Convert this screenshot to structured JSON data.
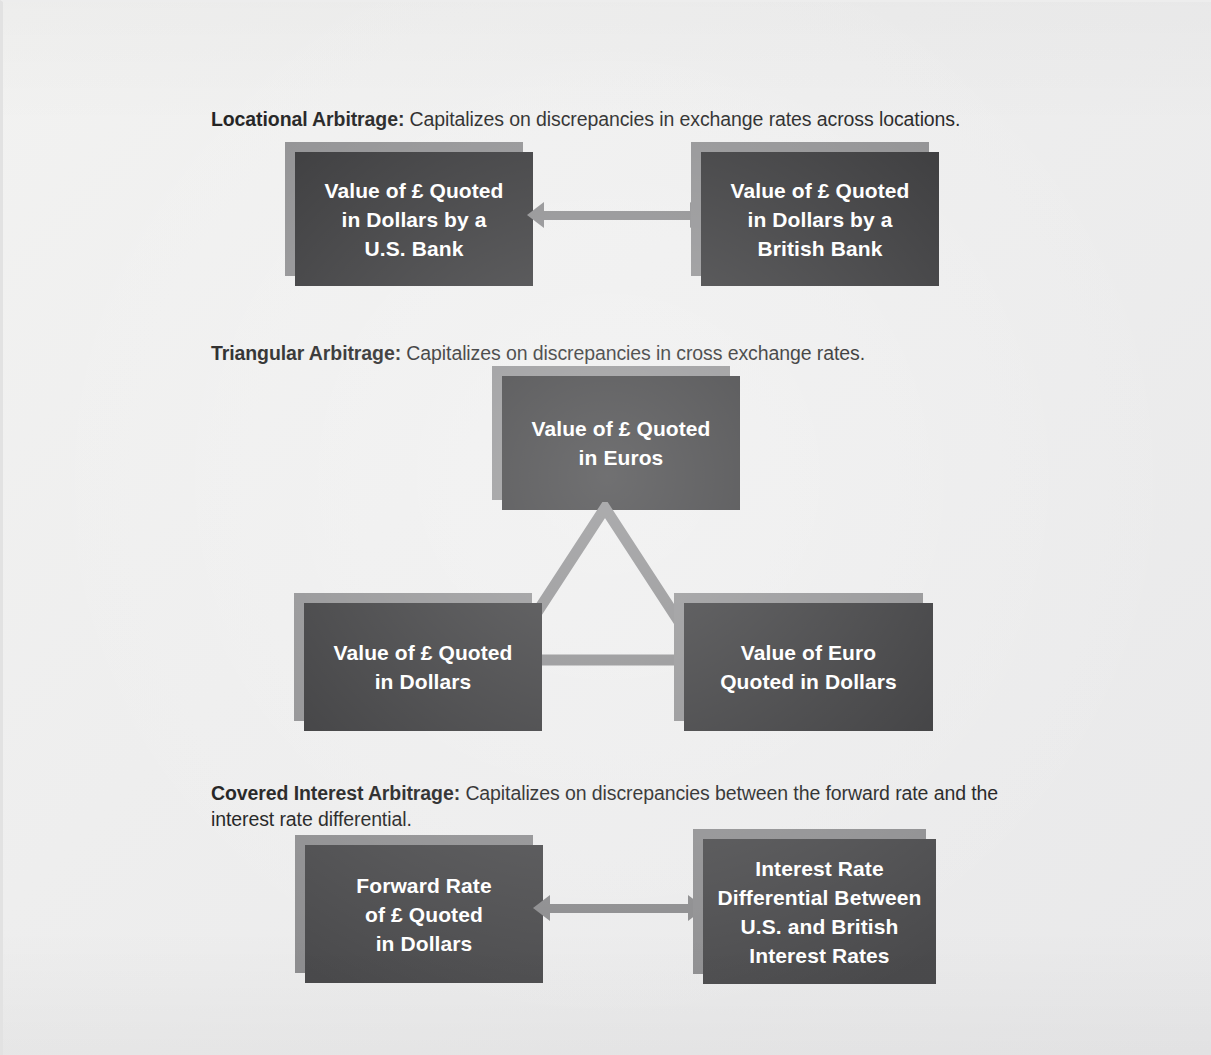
{
  "page": {
    "background_color": "#eceded",
    "box_fill_dark": "#333335",
    "box_fill_light": "#4a4a4c",
    "box_shadow_color": "#8e8e90",
    "connector_color": "#8a8a8c",
    "text_color": "#ffffff",
    "heading_color": "#1d1d1d"
  },
  "sections": [
    {
      "id": "locational",
      "lead": "Locational Arbitrage:",
      "description": " Capitalizes on discrepancies in exchange rates across locations.",
      "nodes": [
        {
          "id": "loc-us-bank",
          "lines": [
            "Value of £ Quoted",
            "in Dollars by a",
            "U.S. Bank"
          ]
        },
        {
          "id": "loc-british-bank",
          "lines": [
            "Value of £ Quoted",
            "in Dollars by a",
            "British Bank"
          ]
        }
      ],
      "connector": {
        "type": "double-arrow",
        "orientation": "horizontal"
      }
    },
    {
      "id": "triangular",
      "lead": "Triangular Arbitrage:",
      "description": " Capitalizes on discrepancies in cross exchange rates.",
      "nodes": [
        {
          "id": "tri-euros",
          "lines": [
            "Value of £ Quoted",
            "in Euros"
          ]
        },
        {
          "id": "tri-pound-dollar",
          "lines": [
            "Value of £ Quoted",
            "in Dollars"
          ]
        },
        {
          "id": "tri-euro-dollar",
          "lines": [
            "Value of Euro",
            "Quoted in Dollars"
          ]
        }
      ],
      "connector": {
        "type": "triangle-outline"
      }
    },
    {
      "id": "covered-interest",
      "lead": "Covered Interest Arbitrage:",
      "description": " Capitalizes on discrepancies between the forward rate and the interest rate differential.",
      "nodes": [
        {
          "id": "cov-forward-rate",
          "lines": [
            "Forward Rate",
            "of £ Quoted",
            "in Dollars"
          ]
        },
        {
          "id": "cov-rate-diff",
          "lines": [
            "Interest Rate",
            "Differential Between",
            "U.S. and British",
            "Interest Rates"
          ]
        }
      ],
      "connector": {
        "type": "double-arrow",
        "orientation": "horizontal"
      }
    }
  ]
}
